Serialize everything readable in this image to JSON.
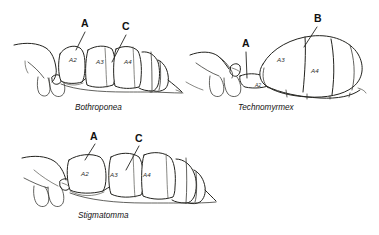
{
  "figure": {
    "type": "scientific-line-drawing",
    "background_color": "#ffffff",
    "line_color": "#23231f",
    "panels": [
      {
        "id": "panel-bothroponera",
        "taxon": "Bothroponea",
        "pointer_labels": [
          {
            "id": "A",
            "text": "A",
            "x": 85,
            "y": 27
          },
          {
            "id": "C",
            "text": "C",
            "x": 125,
            "y": 30
          }
        ],
        "segment_labels": [
          {
            "text": "A2",
            "x": 69,
            "y": 62
          },
          {
            "text": "A3",
            "x": 96,
            "y": 64
          },
          {
            "text": "A4",
            "x": 124,
            "y": 64
          }
        ]
      },
      {
        "id": "panel-technomyrmex",
        "taxon": "Technomyrmex",
        "pointer_labels": [
          {
            "id": "A",
            "text": "A",
            "x": 245,
            "y": 47
          },
          {
            "id": "B",
            "text": "B",
            "x": 318,
            "y": 22
          }
        ],
        "segment_labels": [
          {
            "text": "A2",
            "x": 262,
            "y": 87
          },
          {
            "text": "A3",
            "x": 280,
            "y": 62
          },
          {
            "text": "A4",
            "x": 314,
            "y": 72
          }
        ]
      },
      {
        "id": "panel-stigmatomma",
        "taxon": "Stigmatomma",
        "pointer_labels": [
          {
            "id": "A",
            "text": "A",
            "x": 94,
            "y": 139
          },
          {
            "id": "C",
            "text": "C",
            "x": 138,
            "y": 141
          }
        ],
        "segment_labels": [
          {
            "text": "A2",
            "x": 84,
            "y": 175
          },
          {
            "text": "A3",
            "x": 113,
            "y": 176
          },
          {
            "text": "A4",
            "x": 146,
            "y": 176
          }
        ]
      }
    ]
  }
}
